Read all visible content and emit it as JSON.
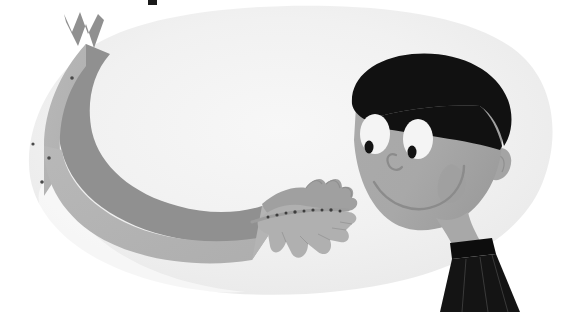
{
  "image": {
    "title": "Cartoon child reaching out with outstretched hands",
    "domain": "Natural-Image",
    "style": "flat vector children's book illustration, grayscale",
    "width": 570,
    "height": 312,
    "background_color": "#ffffff"
  },
  "palette": {
    "page_white": "#ffffff",
    "blob_light": "#f1f1f1",
    "blob_mid": "#ebebeb",
    "blob_shadow": "#e4e4e4",
    "skin": "#a8a8a8",
    "skin_shadow": "#9a9a9a",
    "skin_highlight": "#b2b2b2",
    "hand_back": "#a0a0a0",
    "hand_front": "#b0b0b0",
    "sleeve_light": "#b4b4b4",
    "sleeve_dark": "#909090",
    "hair_black": "#111111",
    "collar_black": "#141414",
    "eye_white": "#f4f4f4",
    "pupil_black": "#131313",
    "line_gray": "#8b8b8b",
    "dot_dark": "#4a4a4a",
    "top_mark": "#1a1a1a"
  },
  "elements": {
    "background_blob": {
      "name": "soft rounded light-gray backdrop shape",
      "fill": "#f1f1f1"
    },
    "arm": {
      "name": "outstretched arm in long sleeve",
      "sleeve_upper_fill": "#b4b4b4",
      "sleeve_band_fill": "#909090",
      "zigzag_notch": "W-shaped notch at shoulder end",
      "button_dots": 4
    },
    "hands": {
      "name": "two open splayed hands reaching forward",
      "count": 2,
      "fingers_per_hand": 5,
      "band_detail": "dark speckled band across the hands"
    },
    "head": {
      "name": "child's head turned to the left, smiling",
      "face_fill": "#a8a8a8",
      "hair_fill": "#111111",
      "ear": "visible on right side of head"
    },
    "eyes": {
      "count": 2,
      "sclera_fill": "#f4f4f4",
      "pupil_fill": "#131313",
      "pupil_position": "lower-left of each eye"
    },
    "nose": {
      "name": "small hooked nose outline",
      "stroke": "#8b8b8b"
    },
    "mouth": {
      "name": "wide curved smile",
      "stroke": "#8b8b8b"
    },
    "neck": {
      "fill": "#a8a8a8"
    },
    "collar": {
      "name": "black collar and shirt with pleats",
      "fill": "#141414",
      "pleat_lines": 3
    },
    "top_mark": {
      "name": "small black mark cropped at top edge",
      "fill": "#1a1a1a"
    }
  }
}
